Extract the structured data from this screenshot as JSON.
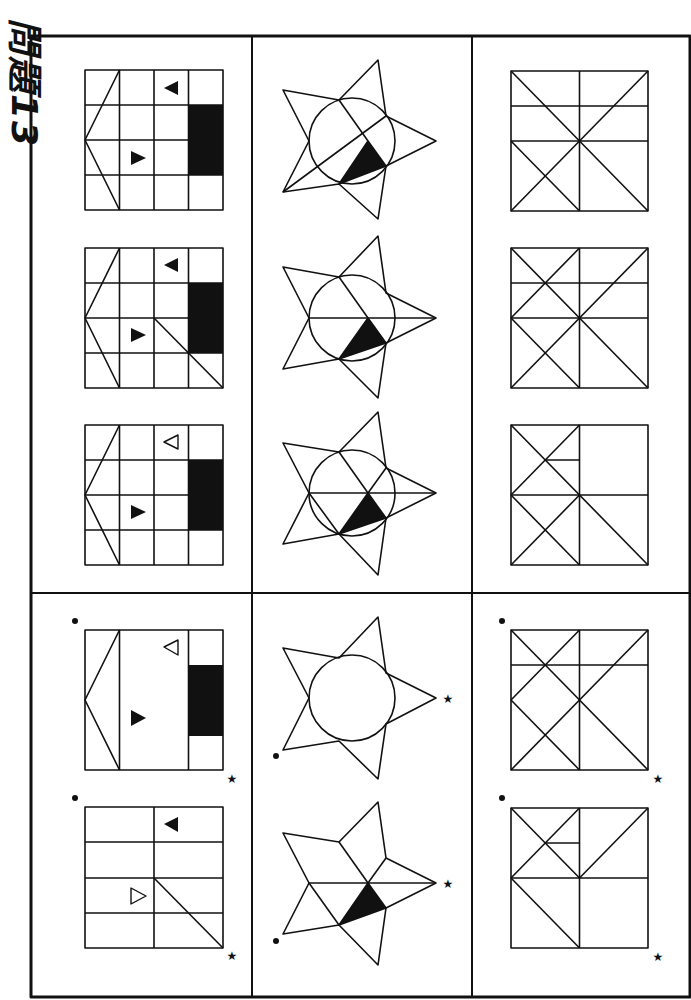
{
  "title": "問題13",
  "layout": {
    "frame": {
      "x": 31,
      "y": 36,
      "w": 659,
      "h": 961
    },
    "column_dividers_x": [
      252,
      472
    ],
    "row_divider_y": 593
  },
  "columns": [
    {
      "name": "grid-with-arrow-shape",
      "question_figures": [
        "grid-4x4-v1",
        "grid-4x4-v2",
        "grid-4x4-v3"
      ],
      "answer_options": [
        "option-a-overlay-strip",
        "option-b-grid-2col"
      ]
    },
    {
      "name": "star-with-circle",
      "question_figures": [
        "star-circle-v1",
        "star-circle-v2",
        "star-circle-v3"
      ],
      "answer_options": [
        "option-a-star-circle",
        "option-b-star-lines"
      ]
    },
    {
      "name": "square-with-diagonals",
      "question_figures": [
        "square-diag-v1",
        "square-diag-v2",
        "square-diag-v3"
      ],
      "answer_options": [
        "option-a-square",
        "option-b-square"
      ]
    }
  ],
  "markers": {
    "dot": "●",
    "star": "★"
  },
  "colors": {
    "ink": "#111111",
    "background": "#ffffff"
  }
}
